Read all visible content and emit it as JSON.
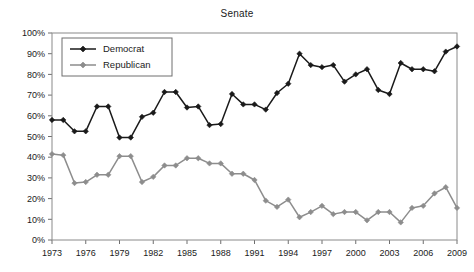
{
  "chart_data": {
    "type": "line",
    "title": "Senate",
    "xlabel": "",
    "ylabel": "",
    "ylim": [
      0,
      100
    ],
    "xlim": [
      1973,
      2009
    ],
    "grid": false,
    "legend_position": "top-left",
    "y_tick_labels": [
      "0%",
      "10%",
      "20%",
      "30%",
      "40%",
      "50%",
      "60%",
      "70%",
      "80%",
      "90%",
      "100%"
    ],
    "y_ticks": [
      0,
      10,
      20,
      30,
      40,
      50,
      60,
      70,
      80,
      90,
      100
    ],
    "x_tick_labels": [
      "1973",
      "1976",
      "1979",
      "1982",
      "1985",
      "1988",
      "1991",
      "1994",
      "1997",
      "2000",
      "2003",
      "2006",
      "2009"
    ],
    "x_ticks": [
      1973,
      1976,
      1979,
      1982,
      1985,
      1988,
      1991,
      1994,
      1997,
      2000,
      2003,
      2006,
      2009
    ],
    "x": [
      1973,
      1974,
      1975,
      1976,
      1977,
      1978,
      1979,
      1980,
      1981,
      1982,
      1983,
      1984,
      1985,
      1986,
      1987,
      1988,
      1989,
      1990,
      1991,
      1992,
      1993,
      1994,
      1995,
      1996,
      1997,
      1998,
      1999,
      2000,
      2001,
      2002,
      2003,
      2004,
      2005,
      2006,
      2007,
      2008,
      2009
    ],
    "series": [
      {
        "name": "Democrat",
        "color": "#1a1a1a",
        "marker": "diamond",
        "values": [
          58,
          58,
          52.5,
          52.5,
          64.5,
          64.5,
          49.5,
          49.5,
          59.5,
          61.5,
          71.5,
          71.5,
          64,
          64.5,
          55.5,
          56,
          70.5,
          65.5,
          65.5,
          63,
          71,
          75.5,
          90,
          84.5,
          83.5,
          84.5,
          76.5,
          80,
          82.5,
          72.5,
          70.5,
          85.5,
          82.5,
          82.5,
          81.5,
          91,
          93.5
        ]
      },
      {
        "name": "Republican",
        "color": "#8d8d8d",
        "marker": "diamond",
        "values": [
          41.5,
          41,
          27.5,
          28,
          31.5,
          31.5,
          40.5,
          40.5,
          28,
          30.5,
          36,
          36,
          39.5,
          39.5,
          37,
          37,
          32,
          32,
          29,
          19,
          16,
          19.5,
          11,
          13.5,
          16.5,
          12.5,
          13.5,
          13.5,
          9.5,
          13.5,
          13.5,
          8.5,
          15.5,
          16.5,
          22.5,
          25.5,
          15.5
        ]
      }
    ]
  },
  "legend": {
    "items": [
      {
        "label": "Democrat"
      },
      {
        "label": "Republican"
      }
    ]
  },
  "colors": {
    "democrat": "#1a1a1a",
    "republican": "#8d8d8d",
    "axis": "#6e6e6e",
    "frame": "#8a8a8a",
    "background": "#ffffff"
  }
}
